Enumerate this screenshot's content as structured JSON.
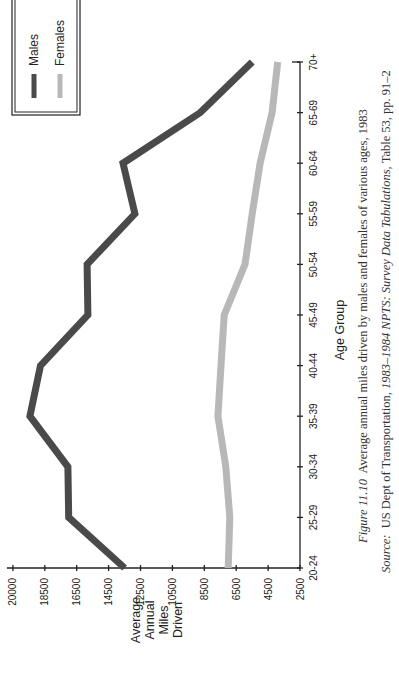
{
  "chart_data": {
    "type": "line",
    "title": "",
    "xlabel": "Age Group",
    "ylabel": "Average Annual Miles Driven",
    "ylabel_lines": [
      "Average",
      "Annual",
      "Miles",
      "Driven"
    ],
    "categories": [
      "20-24",
      "25-29",
      "30-34",
      "35-39",
      "40-44",
      "45-49",
      "50-54",
      "55-59",
      "60-64",
      "65-69",
      "70+"
    ],
    "y_ticks": [
      2500,
      4500,
      6500,
      8500,
      10500,
      12500,
      14500,
      16500,
      18500,
      20000
    ],
    "ylim": [
      2500,
      20000
    ],
    "grid": false,
    "legend_position": "top-right",
    "series": [
      {
        "name": "Males",
        "color": "#4a4a4a",
        "values": [
          13500,
          17000,
          17050,
          19200,
          18700,
          15800,
          15850,
          12850,
          13600,
          8750,
          5500
        ]
      },
      {
        "name": "Females",
        "color": "#b8b8b8",
        "values": [
          7000,
          6900,
          7150,
          7650,
          7450,
          7250,
          5950,
          5500,
          5000,
          4250,
          3900
        ]
      }
    ]
  },
  "caption": {
    "figure_label": "Figure 11.10",
    "figure_text": "Average annual miles driven by males and females of various ages, 1983",
    "source_label": "Source:",
    "source_text_1": "US Dept of Transportation,",
    "source_italic": "1983–1984 NPTS: Survey Data Tabulations,",
    "source_text_2": "Table 53, pp. 91–2"
  }
}
